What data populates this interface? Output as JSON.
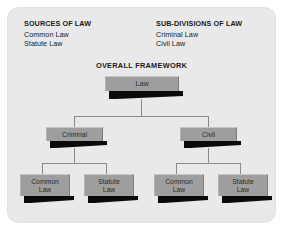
{
  "diagram": {
    "title": "OVERALL FRAMEWORK",
    "panel_color": "#e9e9e9",
    "node_color": "#9e9e9e",
    "shadow_color": "#0a0a0a",
    "connector_color": "#8a8a8a"
  },
  "legends": {
    "sources": {
      "title": "SOURCES OF LAW",
      "items": [
        "Common Law",
        "Statute Law"
      ]
    },
    "subdivisions": {
      "title": "SUB-DIVISIONS OF LAW",
      "items": [
        "Criminal Law",
        "Civil Law"
      ]
    }
  },
  "tree": {
    "root": {
      "label": "Law"
    },
    "level2": [
      {
        "label": "Criminal"
      },
      {
        "label": "Civil"
      }
    ],
    "level3": [
      {
        "line1": "Common",
        "line2": "Law"
      },
      {
        "line1": "Statute",
        "line2": "Law"
      },
      {
        "line1": "Common",
        "line2": "Law"
      },
      {
        "line1": "Statute",
        "line2": "Law"
      }
    ]
  }
}
